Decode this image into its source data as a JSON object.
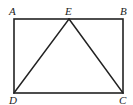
{
  "figure": {
    "shape": "rectangle-with-inscribed-triangle",
    "points": {
      "A": {
        "label": "A",
        "x": 14,
        "y": 19
      },
      "E": {
        "label": "E",
        "x": 69,
        "y": 19
      },
      "B": {
        "label": "B",
        "x": 123,
        "y": 19
      },
      "D": {
        "label": "D",
        "x": 14,
        "y": 93
      },
      "C": {
        "label": "C",
        "x": 123,
        "y": 93
      }
    },
    "segments": [
      "AB",
      "BC",
      "CD",
      "DA",
      "DE",
      "EC"
    ],
    "stroke_color": "#222222"
  }
}
